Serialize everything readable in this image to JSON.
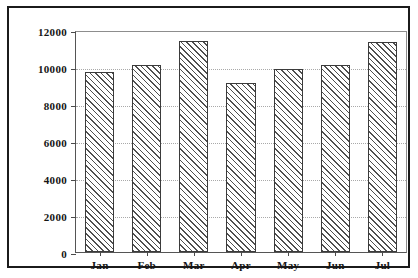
{
  "chart_data": {
    "type": "bar",
    "title": "",
    "subtitle": "",
    "xlabel": "",
    "ylabel": "",
    "categories": [
      "Jan",
      "Feb",
      "Mar",
      "Apr",
      "May",
      "Jun",
      "Jul"
    ],
    "values": [
      9800,
      10200,
      11500,
      9200,
      10000,
      10200,
      11450
    ],
    "series": [
      {
        "name": "",
        "values": [
          9800,
          10200,
          11500,
          9200,
          10000,
          10200,
          11450
        ]
      }
    ],
    "ylim": [
      0,
      12000
    ],
    "yticks": [
      0,
      2000,
      4000,
      6000,
      8000,
      10000,
      12000
    ],
    "ytick_labels": [
      "0",
      "2000",
      "4000",
      "6000",
      "8000",
      "10000",
      "12000"
    ],
    "xtick_labels": [
      "Jan",
      "Feb",
      "Mar",
      "Apr",
      "May",
      "Jun",
      "Jul"
    ],
    "grid": true,
    "grid_axis": "y",
    "grid_style": "dotted",
    "legend": false,
    "legend_position": "none",
    "bar_fill": "hatched-diagonal",
    "bar_edge_color": "#3b3b3b",
    "bar_hatch_color": "#4f4f4f",
    "background_color": "#ffffff",
    "frame_color": "#1b1b1b",
    "annotations": []
  }
}
